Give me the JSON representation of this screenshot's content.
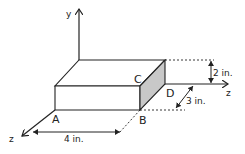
{
  "figure": {
    "axes": {
      "vertical_label": "y",
      "front_label": "z",
      "right_label": "z"
    },
    "points": {
      "A": "A",
      "B": "B",
      "C": "C",
      "D": "D"
    },
    "dimensions": {
      "length": "4 in.",
      "depth": "3 in.",
      "height": "2 in."
    },
    "colors": {
      "line": "#222222",
      "shaded_face": "#c8c8c8",
      "background": "#ffffff"
    }
  }
}
